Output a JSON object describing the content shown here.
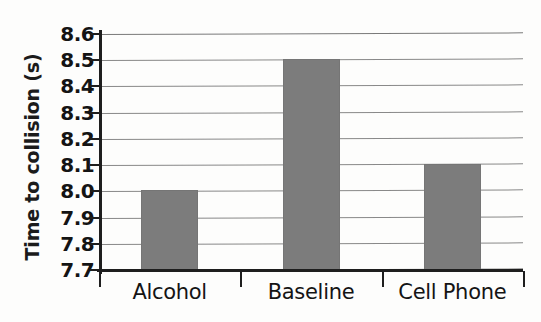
{
  "chart_data": {
    "type": "bar",
    "title": "",
    "xlabel": "",
    "ylabel": "Time to collision (s)",
    "categories": [
      "Alcohol",
      "Baseline",
      "Cell Phone"
    ],
    "values": [
      8.005,
      8.505,
      8.105
    ],
    "ylim": [
      7.7,
      8.6
    ],
    "yticks": [
      "8.6",
      "8.5",
      "8.4",
      "8.3",
      "8.2",
      "8.1",
      "8.0",
      "7.9",
      "7.8",
      "7.7"
    ],
    "ytick_values": [
      8.6,
      8.5,
      8.4,
      8.3,
      8.2,
      8.1,
      8.0,
      7.9,
      7.8,
      7.7
    ],
    "grid": true,
    "legend": "none",
    "bar_color": "#7c7c7c",
    "axis_color": "#1e1e1e",
    "background": "#fdfdfc"
  }
}
